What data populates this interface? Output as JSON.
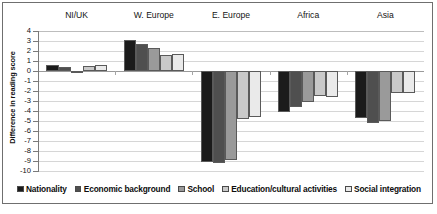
{
  "chart_data": {
    "type": "bar",
    "title": "",
    "xlabel": "",
    "ylabel": "Difference in reading score",
    "ylim": [
      -10,
      4
    ],
    "yticks": [
      4,
      3,
      2,
      1,
      0,
      -1,
      -2,
      -3,
      -4,
      -5,
      -6,
      -7,
      -8,
      -9,
      -10
    ],
    "ytick_labels": [
      "4",
      "3",
      "2",
      "1",
      "0",
      "-1",
      "-2",
      "-3",
      "-4",
      "-5",
      "-6",
      "-7",
      "-8",
      "-9",
      "-10"
    ],
    "grid": true,
    "legend_position": "bottom",
    "categories": [
      "NI/UK",
      "W. Europe",
      "E. Europe",
      "Africa",
      "Asia"
    ],
    "series": [
      {
        "name": "Nationality",
        "color": "#1b1b1b",
        "values": [
          0.65,
          3.1,
          -9.1,
          -4.05,
          -4.7
        ]
      },
      {
        "name": "Economic background",
        "color": "#4f4f4f",
        "values": [
          0.4,
          2.75,
          -9.15,
          -3.55,
          -5.2
        ]
      },
      {
        "name": "School",
        "color": "#9a9a9a",
        "values": [
          0.05,
          2.35,
          -8.85,
          -3.1,
          -5.0
        ]
      },
      {
        "name": "Education/cultural activities",
        "color": "#c9c9c9",
        "values": [
          0.5,
          1.6,
          -4.75,
          -2.45,
          -2.15
        ]
      },
      {
        "name": "Social integration",
        "color": "#eaeaea",
        "values": [
          0.6,
          1.7,
          -4.6,
          -2.6,
          -2.2
        ]
      }
    ]
  }
}
